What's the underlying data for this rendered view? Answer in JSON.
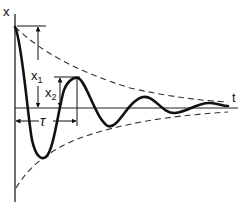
{
  "diagram": {
    "y_axis_label": "x",
    "x_axis_label": "t",
    "amplitude_1_label": "x",
    "amplitude_1_sub": "1",
    "amplitude_2_label": "x",
    "amplitude_2_sub": "2",
    "period_label": "τ",
    "colors": {
      "curve": "#111111",
      "envelope": "#333333",
      "axis": "#222222"
    }
  }
}
